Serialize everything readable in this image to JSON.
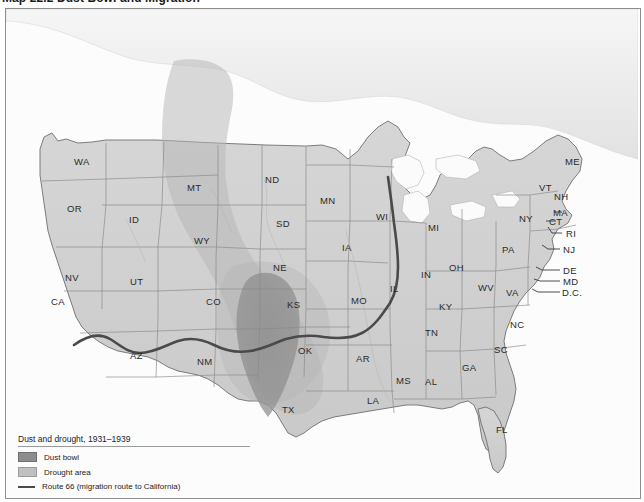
{
  "caption": {
    "number": "Map 22.2",
    "title": "Dust Bowl and Migration",
    "full": "Map 22.2  Dust Bowl and Migration"
  },
  "legend": {
    "title": "Dust and drought, 1931–1939",
    "items": [
      {
        "label": "Dust bowl",
        "swatch": "dust",
        "color": "#8d8d8d"
      },
      {
        "label": "Drought area",
        "swatch": "drought",
        "color": "#c0c0c0"
      },
      {
        "label": "Route 66 (migration route to California)",
        "swatch": "line",
        "color": "#4a4a4a"
      }
    ]
  },
  "map": {
    "colors": {
      "land": "#cfcfcf",
      "water": "#fbfbfb",
      "border": "#8d8d8d",
      "state_line": "#8a8a8a",
      "dust_bowl": "#8d8d8d",
      "drought_area": "#c2c2c2",
      "route66": "#4a4a4a"
    },
    "state_labels": [
      {
        "abbr": "WA",
        "x": 73,
        "y": 152
      },
      {
        "abbr": "OR",
        "x": 66,
        "y": 199
      },
      {
        "abbr": "ID",
        "x": 127,
        "y": 210
      },
      {
        "abbr": "MT",
        "x": 186,
        "y": 178
      },
      {
        "abbr": "WY",
        "x": 193,
        "y": 231
      },
      {
        "abbr": "NV",
        "x": 64,
        "y": 268
      },
      {
        "abbr": "UT",
        "x": 129,
        "y": 272
      },
      {
        "abbr": "CA",
        "x": 50,
        "y": 292
      },
      {
        "abbr": "CO",
        "x": 205,
        "y": 292
      },
      {
        "abbr": "AZ",
        "x": 129,
        "y": 346
      },
      {
        "abbr": "NM",
        "x": 196,
        "y": 352
      },
      {
        "abbr": "ND",
        "x": 264,
        "y": 170
      },
      {
        "abbr": "SD",
        "x": 275,
        "y": 214
      },
      {
        "abbr": "NE",
        "x": 272,
        "y": 258
      },
      {
        "abbr": "KS",
        "x": 286,
        "y": 295
      },
      {
        "abbr": "OK",
        "x": 297,
        "y": 341
      },
      {
        "abbr": "TX",
        "x": 281,
        "y": 400
      },
      {
        "abbr": "MN",
        "x": 319,
        "y": 191
      },
      {
        "abbr": "IA",
        "x": 340,
        "y": 238
      },
      {
        "abbr": "MO",
        "x": 350,
        "y": 291
      },
      {
        "abbr": "AR",
        "x": 355,
        "y": 349
      },
      {
        "abbr": "LA",
        "x": 366,
        "y": 391
      },
      {
        "abbr": "WI",
        "x": 375,
        "y": 207
      },
      {
        "abbr": "IL",
        "x": 388,
        "y": 279
      },
      {
        "abbr": "MS",
        "x": 395,
        "y": 371
      },
      {
        "abbr": "MI",
        "x": 427,
        "y": 218
      },
      {
        "abbr": "IN",
        "x": 419,
        "y": 265
      },
      {
        "abbr": "OH",
        "x": 448,
        "y": 258
      },
      {
        "abbr": "KY",
        "x": 438,
        "y": 297
      },
      {
        "abbr": "TN",
        "x": 424,
        "y": 323
      },
      {
        "abbr": "AL",
        "x": 424,
        "y": 372
      },
      {
        "abbr": "GA",
        "x": 461,
        "y": 358
      },
      {
        "abbr": "FL",
        "x": 495,
        "y": 420
      },
      {
        "abbr": "WV",
        "x": 477,
        "y": 278
      },
      {
        "abbr": "VA",
        "x": 505,
        "y": 283
      },
      {
        "abbr": "NC",
        "x": 509,
        "y": 315
      },
      {
        "abbr": "SC",
        "x": 493,
        "y": 340
      },
      {
        "abbr": "PA",
        "x": 501,
        "y": 240
      },
      {
        "abbr": "NY",
        "x": 518,
        "y": 209
      },
      {
        "abbr": "ME",
        "x": 564,
        "y": 152
      },
      {
        "abbr": "VT",
        "x": 538,
        "y": 178
      },
      {
        "abbr": "NH",
        "x": 553,
        "y": 187
      },
      {
        "abbr": "MA",
        "x": 552,
        "y": 203
      },
      {
        "abbr": "CT",
        "x": 548,
        "y": 212
      },
      {
        "abbr": "RI",
        "x": 565,
        "y": 224
      },
      {
        "abbr": "NJ",
        "x": 562,
        "y": 240
      },
      {
        "abbr": "DE",
        "x": 562,
        "y": 261
      },
      {
        "abbr": "MD",
        "x": 562,
        "y": 272
      },
      {
        "abbr": "D.C.",
        "x": 561,
        "y": 283
      }
    ]
  }
}
